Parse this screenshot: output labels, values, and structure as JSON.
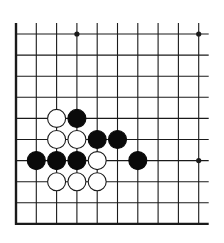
{
  "diagram": {
    "type": "go-board-fragment",
    "colors": {
      "background": "#ffffff",
      "line": "#1a1a1a",
      "black_stone": "#0a0a0a",
      "white_stone_fill": "#ffffff",
      "white_stone_stroke": "#1a1a1a"
    },
    "grid": {
      "cols": 10,
      "rows": 10,
      "origin_x": 16,
      "origin_y": 34,
      "spacing_x": 20.3,
      "spacing_y": 21.1,
      "open_top": true,
      "open_right": true,
      "thick_left": true,
      "thick_bottom": true,
      "stone_radius": 9
    },
    "star_points": [
      {
        "col": 3,
        "row": 0
      },
      {
        "col": 9,
        "row": 0
      },
      {
        "col": 9,
        "row": 6
      }
    ],
    "stones": [
      {
        "color": "white",
        "col": 2,
        "row": 4
      },
      {
        "color": "black",
        "col": 3,
        "row": 4
      },
      {
        "color": "white",
        "col": 2,
        "row": 5
      },
      {
        "color": "white",
        "col": 3,
        "row": 5
      },
      {
        "color": "black",
        "col": 4,
        "row": 5
      },
      {
        "color": "black",
        "col": 5,
        "row": 5
      },
      {
        "color": "black",
        "col": 1,
        "row": 6
      },
      {
        "color": "black",
        "col": 2,
        "row": 6
      },
      {
        "color": "black",
        "col": 3,
        "row": 6
      },
      {
        "color": "white",
        "col": 4,
        "row": 6
      },
      {
        "color": "black",
        "col": 6,
        "row": 6
      },
      {
        "color": "white",
        "col": 2,
        "row": 7
      },
      {
        "color": "white",
        "col": 3,
        "row": 7
      },
      {
        "color": "white",
        "col": 4,
        "row": 7
      }
    ]
  }
}
